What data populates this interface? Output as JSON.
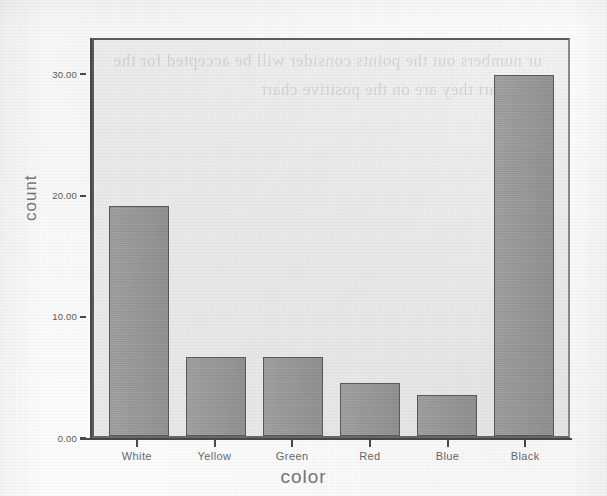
{
  "chart_data": {
    "type": "bar",
    "title": "",
    "subtitle": "",
    "xlabel": "color",
    "ylabel": "count",
    "categories": [
      "White",
      "Yellow",
      "Green",
      "Red",
      "Blue",
      "Black"
    ],
    "values": [
      19.0,
      6.5,
      6.5,
      4.4,
      3.4,
      29.8
    ],
    "series": [
      {
        "name": "count",
        "values": [
          19.0,
          6.5,
          6.5,
          4.4,
          3.4,
          29.8
        ]
      }
    ],
    "ylim": [
      0,
      33
    ],
    "ytick_values": [
      0,
      10,
      20,
      30
    ],
    "ytick_labels": [
      "0.00",
      "10.00",
      "20.00",
      "30.00"
    ],
    "grid": false,
    "legend": false,
    "legend_position": "none",
    "orientation": "vertical",
    "bar_fill_color": "#9b9b9b",
    "bar_border_color": "#5a5a5a",
    "plot_background_color": "#efefef",
    "axis_color": "#4a4a4a",
    "tick_label_color": "#5c5c5c",
    "axis_title_color": "#7a7a7a",
    "page_background_color": "#fdfdfd"
  },
  "artifacts": {
    "bleed_through_text": "ur numbers out the points consider will be accepted for the bar chart they are on the positive chart"
  }
}
